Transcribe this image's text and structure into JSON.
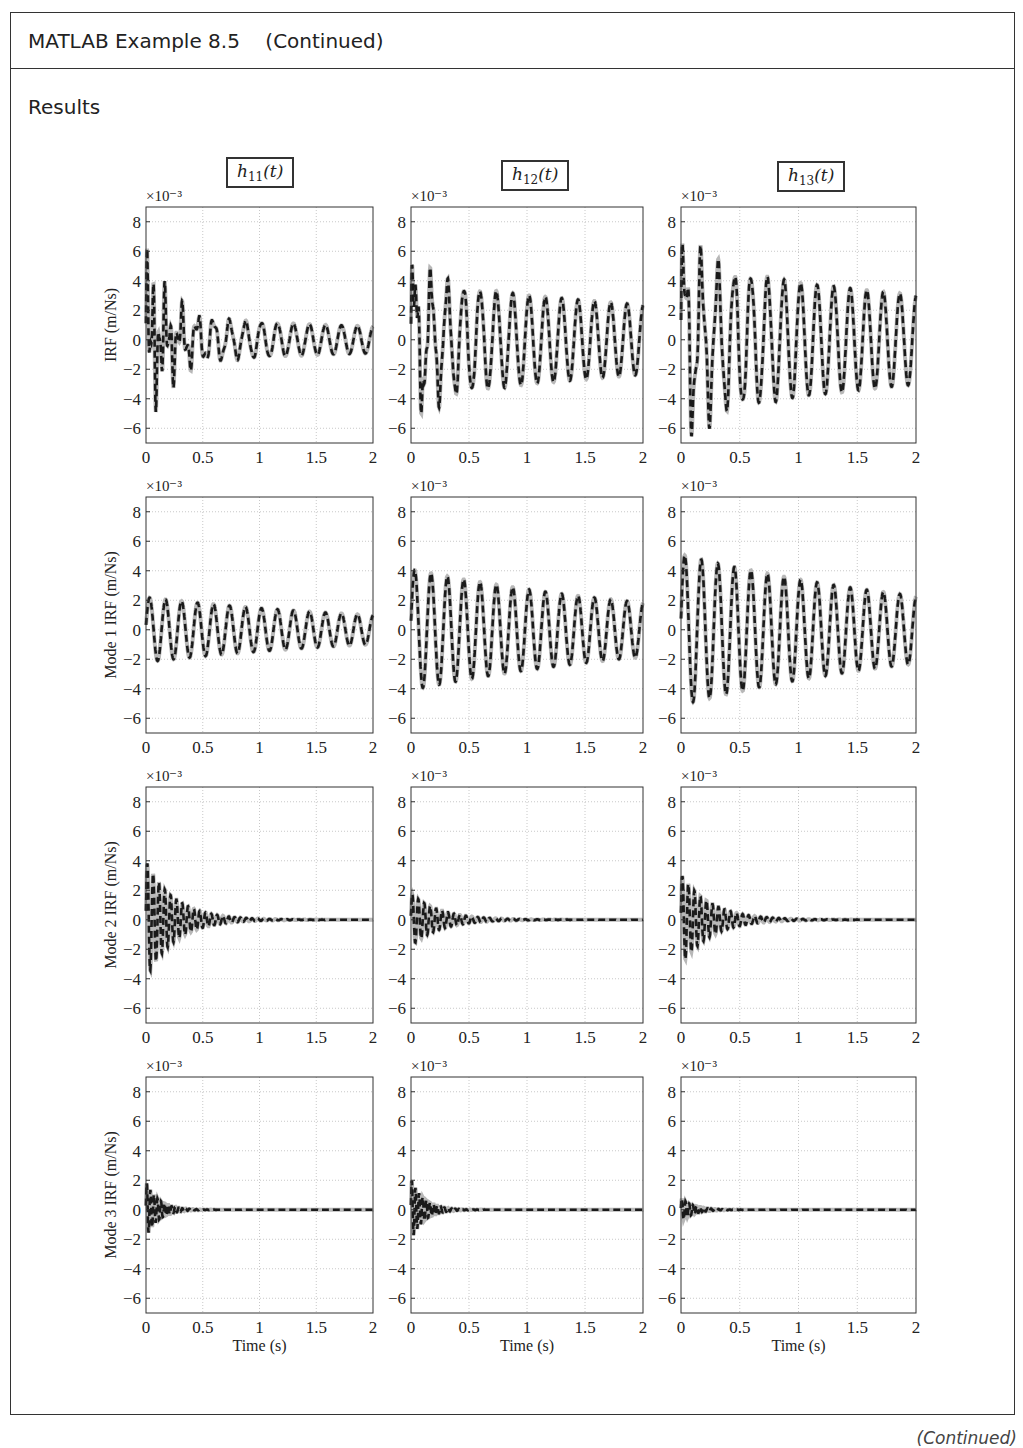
{
  "header": {
    "title": "MATLAB Example 8.5    (Continued)"
  },
  "section": {
    "title": "Results"
  },
  "footer": {
    "continued": "(Continued)"
  },
  "columns": [
    {
      "label": "h",
      "sub": "11",
      "arg": "(t)"
    },
    {
      "label": "h",
      "sub": "12",
      "arg": "(t)"
    },
    {
      "label": "h",
      "sub": "13",
      "arg": "(t)"
    }
  ],
  "colors": {
    "exact": "#b8b8b8",
    "approx": "#1a1a1a",
    "grid": "#c8c8c8",
    "axis": "#333333"
  },
  "chart_data": {
    "type": "line",
    "xlabel": "Time (s)",
    "ylabel_rows": [
      "IRF (m/Ns)",
      "Mode 1 IRF (m/Ns)",
      "Mode 2 IRF (m/Ns)",
      "Mode 3 IRF (m/Ns)"
    ],
    "y_multiplier": "×10⁻³",
    "xlim": [
      0,
      2
    ],
    "ylim": [
      -7,
      9
    ],
    "xticks": [
      "0",
      "0.5",
      "1",
      "1.5",
      "2"
    ],
    "yticks": [
      "8",
      "6",
      "4",
      "2",
      "0",
      "−2",
      "−4",
      "−6"
    ],
    "grid": true,
    "series_styles": [
      {
        "name": "exact",
        "style": "solid light gray, thick"
      },
      {
        "name": "approximate",
        "style": "dashed black"
      }
    ],
    "panels": [
      {
        "row": 0,
        "col": 0,
        "name": "h11(t)",
        "peak": 6.8,
        "min": -5.2,
        "steady_amp": 0.9,
        "freq_hz": 7.1,
        "decay": 0.25,
        "modes": [
          [
            1.5,
            7.1,
            0.25
          ],
          [
            3.8,
            19.5,
            4.0
          ],
          [
            2.2,
            32,
            7.0
          ]
        ]
      },
      {
        "row": 0,
        "col": 1,
        "name": "h12(t)",
        "peak": 5.8,
        "min": -4.3,
        "steady_amp": 1.6,
        "freq_hz": 7.1,
        "decay": 0.25,
        "modes": [
          [
            3.9,
            7.1,
            0.25
          ],
          [
            1.6,
            19.5,
            4.0
          ],
          [
            1.8,
            32,
            7.0
          ]
        ]
      },
      {
        "row": 0,
        "col": 2,
        "name": "h13(t)",
        "peak": 8.6,
        "min": -6.6,
        "steady_amp": 2.0,
        "freq_hz": 7.1,
        "decay": 0.25,
        "modes": [
          [
            5.0,
            7.1,
            0.25
          ],
          [
            3.0,
            19.5,
            4.0
          ],
          [
            1.0,
            32,
            7.0
          ]
        ]
      },
      {
        "row": 1,
        "col": 0,
        "name": "Mode 1 h11",
        "peak": 2.3,
        "min": -2.2,
        "modes": [
          [
            2.2,
            7.1,
            0.4
          ]
        ]
      },
      {
        "row": 1,
        "col": 1,
        "name": "Mode 1 h12",
        "peak": 4.2,
        "min": -4.2,
        "modes": [
          [
            4.1,
            7.1,
            0.4
          ]
        ]
      },
      {
        "row": 1,
        "col": 2,
        "name": "Mode 1 h13",
        "peak": 5.2,
        "min": -5.0,
        "modes": [
          [
            5.1,
            7.1,
            0.4
          ]
        ]
      },
      {
        "row": 2,
        "col": 0,
        "name": "Mode 2 h11",
        "peak": 4.0,
        "min": -3.9,
        "modes": [
          [
            4.0,
            19.5,
            4.0
          ]
        ]
      },
      {
        "row": 2,
        "col": 1,
        "name": "Mode 2 h12",
        "peak": 1.8,
        "min": -1.7,
        "modes": [
          [
            1.8,
            19.5,
            4.0
          ]
        ]
      },
      {
        "row": 2,
        "col": 2,
        "name": "Mode 2 h13",
        "peak": 3.0,
        "min": -3.2,
        "modes": [
          [
            3.1,
            19.5,
            4.0
          ]
        ]
      },
      {
        "row": 3,
        "col": 0,
        "name": "Mode 3 h11",
        "peak": 2.0,
        "min": -1.5,
        "modes": [
          [
            1.9,
            32,
            9.0
          ]
        ]
      },
      {
        "row": 3,
        "col": 1,
        "name": "Mode 3 h12",
        "peak": 2.0,
        "min": -2.2,
        "modes": [
          [
            2.1,
            32,
            9.0
          ]
        ]
      },
      {
        "row": 3,
        "col": 2,
        "name": "Mode 3 h13",
        "peak": 0.9,
        "min": -0.6,
        "modes": [
          [
            0.8,
            32,
            9.0
          ]
        ]
      }
    ]
  }
}
